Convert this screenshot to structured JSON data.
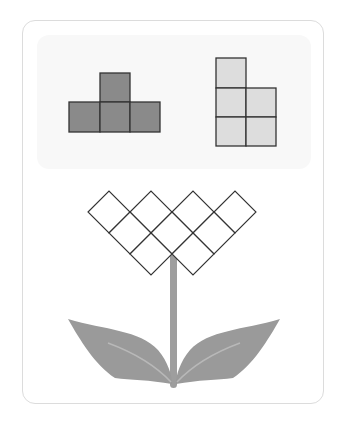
{
  "puzzle": {
    "colors": {
      "dark_shape_fill": "#8a8a8a",
      "light_shape_fill": "#dddddd",
      "outline": "#333333",
      "stem": "#9e9e9e",
      "leaf": "#9a9a9a",
      "leaf_vein": "#b8b8b8",
      "card_border": "#dcdcdc",
      "panel_bg": "#f8f8f8"
    },
    "pieces": [
      {
        "name": "dark-t-piece",
        "cells": [
          [
            1,
            0
          ],
          [
            0,
            1
          ],
          [
            1,
            1
          ],
          [
            2,
            1
          ]
        ],
        "fill": "dark"
      },
      {
        "name": "light-p-piece",
        "cells": [
          [
            0,
            0
          ],
          [
            0,
            1
          ],
          [
            1,
            1
          ],
          [
            0,
            2
          ],
          [
            1,
            2
          ]
        ],
        "fill": "light"
      }
    ],
    "flower_grid": {
      "rows": [
        4,
        3,
        2
      ],
      "description": "diamond grid of 9 rhombus cells forming flower head"
    }
  }
}
